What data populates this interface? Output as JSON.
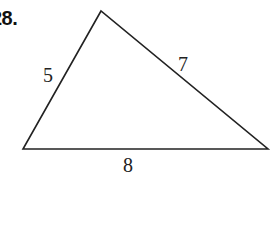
{
  "problem": {
    "number": "28."
  },
  "triangle": {
    "sides": [
      {
        "name": "left",
        "label": "5"
      },
      {
        "name": "right",
        "label": "7"
      },
      {
        "name": "base",
        "label": "8"
      }
    ],
    "stroke_color": "#222222"
  }
}
